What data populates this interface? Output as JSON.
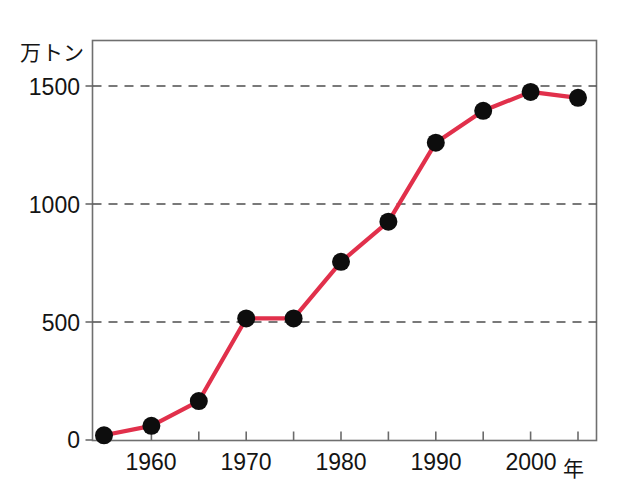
{
  "chart_data": {
    "type": "line",
    "title": "",
    "subtitle": "",
    "xlabel": "年",
    "ylabel": "万トン",
    "x": [
      1955,
      1960,
      1965,
      1970,
      1975,
      1980,
      1985,
      1990,
      1995,
      2000,
      2005
    ],
    "values": [
      20,
      60,
      165,
      515,
      515,
      755,
      925,
      1260,
      1395,
      1475,
      1450
    ],
    "series": [
      {
        "name": "",
        "values": [
          20,
          60,
          165,
          515,
          515,
          755,
          925,
          1260,
          1395,
          1475,
          1450
        ]
      }
    ],
    "xlim": [
      1954,
      1963.5
    ],
    "ylim": [
      0,
      1600
    ],
    "xtick_labels": [
      "1960",
      "1970",
      "1980",
      "1990",
      "2000"
    ],
    "xtick_values": [
      1960,
      1970,
      1980,
      1990,
      2000
    ],
    "xminor_tick_values": [
      1955,
      1960,
      1965,
      1970,
      1975,
      1980,
      1985,
      1990,
      1995,
      2000,
      2005
    ],
    "ytick_labels": [
      "0",
      "500",
      "1000",
      "1500"
    ],
    "ytick_values": [
      0,
      500,
      1000,
      1500
    ],
    "grid": "horizontal-dashed",
    "legend": "none",
    "line_color": "#e1304b",
    "marker_color": "#0d0d0d",
    "marker_shape": "circle",
    "axis_color": "#6b6b6b",
    "grid_color": "#4d4d4d",
    "background_color": "#ffffff"
  },
  "axis": {
    "y_unit": "万トン",
    "x_unit": "年"
  },
  "y_ticks": [
    {
      "label": "1500",
      "value": 1500
    },
    {
      "label": "1000",
      "value": 1000
    },
    {
      "label": "500",
      "value": 500
    },
    {
      "label": "0",
      "value": 0
    }
  ],
  "x_ticks": [
    {
      "label": "1960",
      "value": 1960
    },
    {
      "label": "1970",
      "value": 1970
    },
    {
      "label": "1980",
      "value": 1980
    },
    {
      "label": "1990",
      "value": 1990
    },
    {
      "label": "2000",
      "value": 2000
    }
  ]
}
